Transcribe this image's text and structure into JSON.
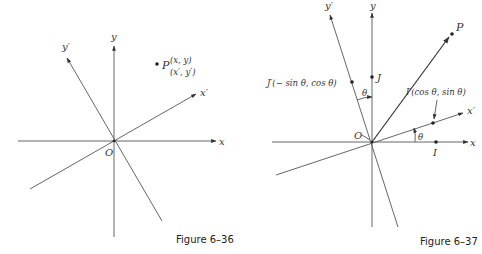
{
  "figures": [
    {
      "id": "fig-6-36",
      "caption": "Figure 6–36",
      "origin_label": "O",
      "axes": {
        "x": "x",
        "y": "y",
        "x_prime": "x′",
        "y_prime": "y′"
      },
      "point": {
        "name": "P",
        "coords_xy": "(x, y)",
        "coords_prime": "(x′, y′)"
      }
    },
    {
      "id": "fig-6-37",
      "caption": "Figure 6–37",
      "origin_label": "O",
      "axes": {
        "x": "x",
        "y": "y",
        "x_prime": "x′",
        "y_prime": "y′"
      },
      "points": {
        "P": "P",
        "J": "J",
        "J_prime": "J′(− sin θ, cos θ)",
        "I": "I",
        "I_prime": "I′(cos θ, sin θ)"
      },
      "angle_labels": {
        "between_y_and_y_prime": "θ",
        "between_x_and_x_prime": "θ"
      }
    }
  ]
}
